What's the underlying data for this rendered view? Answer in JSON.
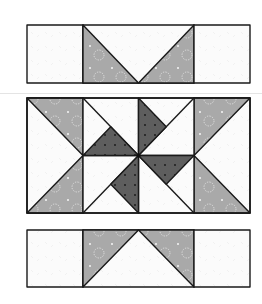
{
  "diagram": {
    "colors": {
      "background": "#ffffff",
      "outline": "#1a1a1a",
      "white_fabric": "#fbfbfb",
      "white_print": "#ececec",
      "medium_fabric": "#a9a9a9",
      "medium_print": "#f2f2f2",
      "dark_fabric": "#5e5e5e",
      "dark_print": "#1c1c1c",
      "divider": "#e4e4e4"
    },
    "rows": [
      {
        "name": "top-strip",
        "units": [
          "plain-square",
          "flying-geese-down",
          "plain-square"
        ]
      },
      {
        "name": "center-row",
        "units": [
          "hourglass-left",
          "pinwheel-center",
          "hourglass-right"
        ]
      },
      {
        "name": "bottom-strip",
        "units": [
          "plain-square",
          "flying-geese-up",
          "plain-square"
        ]
      }
    ]
  }
}
